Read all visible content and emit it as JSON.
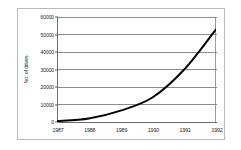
{
  "chart_data": {
    "type": "line",
    "title": "",
    "xlabel": "",
    "ylabel": "No. of drives",
    "categories": [
      "1987",
      "1988",
      "1989",
      "1990",
      "1991",
      "1992"
    ],
    "x": [
      1987,
      1988,
      1989,
      1990,
      1991,
      1992
    ],
    "values": [
      500,
      2000,
      6500,
      14000,
      30000,
      53000
    ],
    "series": [
      {
        "name": "No. of drives",
        "values": [
          500,
          2000,
          6500,
          14000,
          30000,
          53000
        ]
      }
    ],
    "ylim": [
      0,
      60000
    ],
    "xlim": [
      1987,
      1992
    ],
    "yticks": [
      0,
      10000,
      20000,
      30000,
      40000,
      50000,
      60000
    ],
    "ytick_labels": [
      "0",
      "10000",
      "20000",
      "30000",
      "40000",
      "50000",
      "60000"
    ],
    "xtick_labels": [
      "1987",
      "1988",
      "1989",
      "1990",
      "1991",
      "1992"
    ],
    "grid": "horizontal",
    "legend": "none",
    "line_color": "#000000",
    "line_width": 2,
    "markers": "none",
    "background_color": "#ffffff",
    "grid_color": "#8d8d8d",
    "frame_color": "#b9b9b9"
  }
}
